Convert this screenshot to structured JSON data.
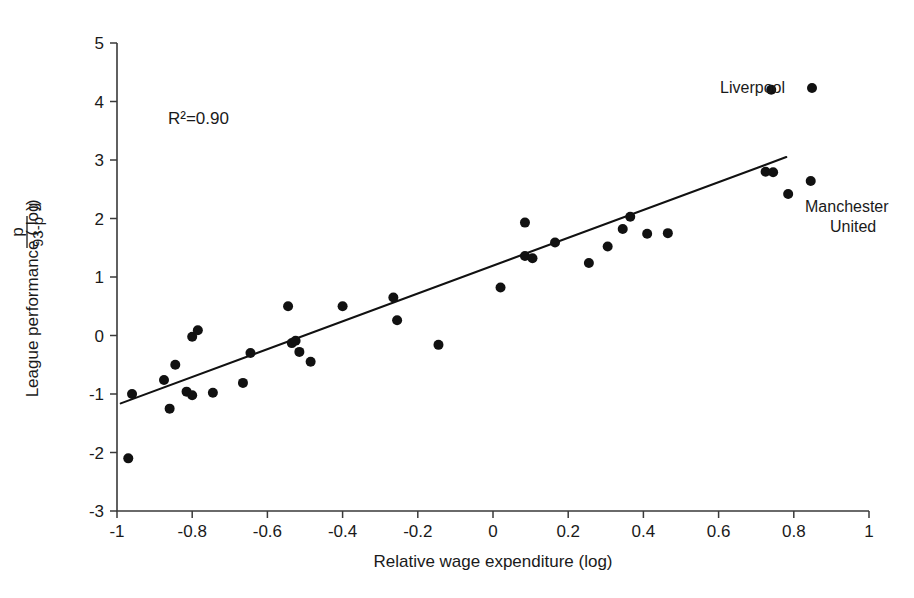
{
  "chart_data": {
    "type": "scatter",
    "title": "",
    "subtitle": "",
    "xlabel": "Relative wage expenditure (log)",
    "ylabel": "League performance (log(p/(93-p)))",
    "ylabel_parts": {
      "prefix": "League performance ( log ",
      "paren_open": "(",
      "numerator": "p",
      "denominator": "93-p",
      "paren_close": "))"
    },
    "xlim": [
      -1,
      1
    ],
    "ylim": [
      -3,
      5
    ],
    "xticks": [
      -1,
      -0.8,
      -0.6,
      -0.4,
      -0.2,
      0,
      0.2,
      0.4,
      0.6,
      0.8,
      1
    ],
    "xtick_labels": [
      "-1",
      "-0.8",
      "-0.6",
      "-0.4",
      "-0.2",
      "0",
      "0.2",
      "0.4",
      "0.6",
      "0.8",
      "1"
    ],
    "yticks": [
      -3,
      -2,
      -1,
      0,
      1,
      2,
      3,
      4,
      5
    ],
    "ytick_labels": [
      "-3",
      "-2",
      "-1",
      "0",
      "1",
      "2",
      "3",
      "4",
      "5"
    ],
    "grid": false,
    "legend": "none",
    "annotations": [
      {
        "name": "r-squared",
        "text": "R²=0.90",
        "x": -0.83,
        "y": 3.62
      },
      {
        "name": "liverpool",
        "text": "Liverpool",
        "x": 0.6,
        "y": 4.2
      },
      {
        "name": "manchester-united-line1",
        "text": "Manchester",
        "x": 0.855,
        "y": 2.22
      },
      {
        "name": "manchester-united-line2",
        "text": "United",
        "x": 0.855,
        "y": 1.94
      }
    ],
    "fit_line": {
      "name": "regression-line",
      "x_start": -0.99,
      "y_start": -1.16,
      "x_end": 0.78,
      "y_end": 3.05,
      "r_squared": 0.9
    },
    "points": [
      {
        "x": -0.97,
        "y": -2.1,
        "label": ""
      },
      {
        "x": -0.96,
        "y": -1.0,
        "label": ""
      },
      {
        "x": -0.875,
        "y": -0.76,
        "label": ""
      },
      {
        "x": -0.86,
        "y": -1.25,
        "label": ""
      },
      {
        "x": -0.845,
        "y": -0.5,
        "label": ""
      },
      {
        "x": -0.815,
        "y": -0.96,
        "label": ""
      },
      {
        "x": -0.8,
        "y": -1.02,
        "label": ""
      },
      {
        "x": -0.8,
        "y": -0.02,
        "label": ""
      },
      {
        "x": -0.785,
        "y": 0.09,
        "label": ""
      },
      {
        "x": -0.745,
        "y": -0.98,
        "label": ""
      },
      {
        "x": -0.665,
        "y": -0.81,
        "label": ""
      },
      {
        "x": -0.645,
        "y": -0.3,
        "label": ""
      },
      {
        "x": -0.545,
        "y": 0.5,
        "label": ""
      },
      {
        "x": -0.535,
        "y": -0.13,
        "label": ""
      },
      {
        "x": -0.525,
        "y": -0.09,
        "label": ""
      },
      {
        "x": -0.515,
        "y": -0.28,
        "label": ""
      },
      {
        "x": -0.485,
        "y": -0.45,
        "label": ""
      },
      {
        "x": -0.4,
        "y": 0.5,
        "label": ""
      },
      {
        "x": -0.265,
        "y": 0.65,
        "label": ""
      },
      {
        "x": -0.255,
        "y": 0.26,
        "label": ""
      },
      {
        "x": -0.145,
        "y": -0.16,
        "label": ""
      },
      {
        "x": 0.02,
        "y": 0.82,
        "label": ""
      },
      {
        "x": 0.085,
        "y": 1.93,
        "label": ""
      },
      {
        "x": 0.085,
        "y": 1.36,
        "label": ""
      },
      {
        "x": 0.105,
        "y": 1.32,
        "label": ""
      },
      {
        "x": 0.165,
        "y": 1.59,
        "label": ""
      },
      {
        "x": 0.255,
        "y": 1.24,
        "label": ""
      },
      {
        "x": 0.305,
        "y": 1.52,
        "label": ""
      },
      {
        "x": 0.345,
        "y": 1.82,
        "label": ""
      },
      {
        "x": 0.365,
        "y": 2.03,
        "label": ""
      },
      {
        "x": 0.41,
        "y": 1.74,
        "label": ""
      },
      {
        "x": 0.465,
        "y": 1.75,
        "label": ""
      },
      {
        "x": 0.725,
        "y": 2.8,
        "label": ""
      },
      {
        "x": 0.745,
        "y": 2.79,
        "label": ""
      },
      {
        "x": 0.74,
        "y": 4.2,
        "label": "Liverpool"
      },
      {
        "x": 0.785,
        "y": 2.42,
        "label": "Manchester United"
      },
      {
        "x": 0.845,
        "y": 2.64,
        "label": ""
      }
    ],
    "colors": {
      "point": "#111111",
      "line": "#111111",
      "axis": "#3a3a3a",
      "text": "#1a1a1a",
      "background": "#ffffff"
    }
  }
}
